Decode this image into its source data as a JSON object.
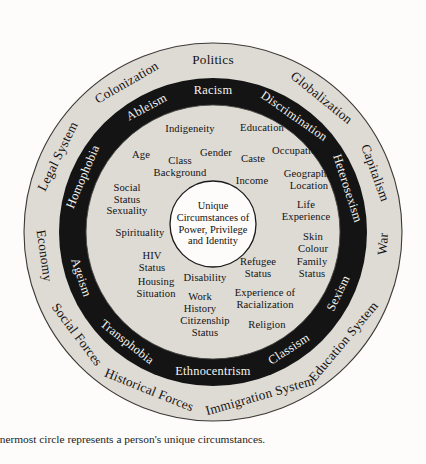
{
  "figure": {
    "caption": "nnermost circle represents a person's unique circumstances.",
    "colors": {
      "background": "#fdfcfa",
      "ring_light": "#dedad4",
      "ring_dark": "#141414",
      "ring_dark_text": "#f6f4f0",
      "text": "#131313",
      "core_fill": "#fdfcfa"
    }
  },
  "core": {
    "label": "Unique\nCircumstances of\nPower, Privilege\nand Identity"
  },
  "rings": {
    "outer": {
      "name": "Social and Structural Forces",
      "labels": [
        {
          "text": "Politics",
          "angle": -90,
          "size": 13.8
        },
        {
          "text": "Globalization",
          "angle": -51,
          "size": 13.4
        },
        {
          "text": "Capitalism",
          "angle": -20,
          "size": 13.2
        },
        {
          "text": "War",
          "angle": 4,
          "size": 13.2
        },
        {
          "text": "Education System",
          "angle": 40,
          "size": 13.0
        },
        {
          "text": "Immigration System",
          "angle": 74,
          "size": 13.0
        },
        {
          "text": "Historical Forces",
          "angle": 112,
          "size": 13.0
        },
        {
          "text": "Social Forces",
          "angle": 143,
          "size": 13.0
        },
        {
          "text": "Economy",
          "angle": 172,
          "size": 13.0
        },
        {
          "text": "Legal System",
          "angle": -154,
          "size": 13.0
        },
        {
          "text": "Colonization",
          "angle": -120,
          "size": 13.4
        }
      ]
    },
    "middle_dark": {
      "name": "Systems of Oppression",
      "labels": [
        {
          "text": "Racism",
          "angle": -90,
          "size": 13.0
        },
        {
          "text": "Discrimination",
          "angle": -55,
          "size": 12.8
        },
        {
          "text": "Heterosexism",
          "angle": -18,
          "size": 12.6
        },
        {
          "text": "Sexism",
          "angle": 26,
          "size": 12.6
        },
        {
          "text": "Classism",
          "angle": 57,
          "size": 12.6
        },
        {
          "text": "Ethnocentrism",
          "angle": 90,
          "size": 12.8
        },
        {
          "text": "Transphobia",
          "angle": 128,
          "size": 12.6
        },
        {
          "text": "Ageism",
          "angle": 161,
          "size": 12.6
        },
        {
          "text": "Homophobia",
          "angle": -157,
          "size": 12.6
        },
        {
          "text": "Ableism",
          "angle": -118,
          "size": 12.8
        }
      ]
    },
    "inner": {
      "name": "Aspects of Identity",
      "labels": [
        {
          "text": "Indigeneity",
          "x": 190,
          "y": 129
        },
        {
          "text": "Education",
          "x": 262,
          "y": 128
        },
        {
          "text": "Gender",
          "x": 216,
          "y": 153
        },
        {
          "text": "Caste",
          "x": 253,
          "y": 159
        },
        {
          "text": "Occupation",
          "x": 297,
          "y": 151
        },
        {
          "text": "Age",
          "x": 141,
          "y": 155
        },
        {
          "text": "Class\nBackground",
          "x": 180,
          "y": 167
        },
        {
          "text": "Income",
          "x": 252,
          "y": 181
        },
        {
          "text": "Geographic\nLocation",
          "x": 309,
          "y": 180
        },
        {
          "text": "Social\nStatus\nSexuality",
          "x": 127,
          "y": 199
        },
        {
          "text": "Life\nExperience",
          "x": 306,
          "y": 211
        },
        {
          "text": "Spirituality",
          "x": 140,
          "y": 233
        },
        {
          "text": "Skin\nColour",
          "x": 313,
          "y": 243
        },
        {
          "text": "HIV\nStatus",
          "x": 152,
          "y": 262
        },
        {
          "text": "Refugee\nStatus",
          "x": 258,
          "y": 268
        },
        {
          "text": "Family\nStatus",
          "x": 312,
          "y": 268
        },
        {
          "text": "Disability",
          "x": 205,
          "y": 278
        },
        {
          "text": "Housing\nSituation",
          "x": 156,
          "y": 288
        },
        {
          "text": "Work\nHistory",
          "x": 200,
          "y": 303
        },
        {
          "text": "Experience of\nRacialization",
          "x": 265,
          "y": 299
        },
        {
          "text": "Citizenship\nStatus",
          "x": 205,
          "y": 327
        },
        {
          "text": "Religion",
          "x": 267,
          "y": 325
        }
      ]
    }
  }
}
